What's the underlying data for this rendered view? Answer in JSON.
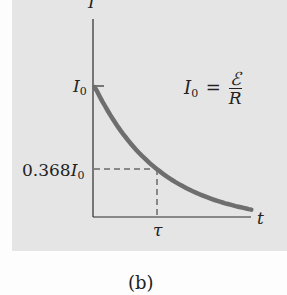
{
  "chart_data": {
    "type": "line",
    "title": "",
    "caption": "(b)",
    "xlabel": "t",
    "ylabel": "I",
    "x_ticks": [
      {
        "label": "τ",
        "value": 1
      }
    ],
    "y_ticks": [
      {
        "label": "I",
        "sub": "0",
        "value": 1.0
      },
      {
        "label": "0.368I",
        "sub": "0",
        "value": 0.368
      }
    ],
    "annotation": {
      "lhs": "I",
      "lhs_sub": "0",
      "eq": "=",
      "numerator": "ℰ",
      "denominator": "R"
    },
    "function": "I(t) = I0 * exp(-t/τ)",
    "series": [
      {
        "name": "I(t)",
        "x": [
          0,
          0.25,
          0.5,
          0.75,
          1.0,
          1.25,
          1.5,
          1.75,
          2.0,
          2.25,
          2.45
        ],
        "y": [
          1.0,
          0.779,
          0.607,
          0.472,
          0.368,
          0.287,
          0.223,
          0.174,
          0.135,
          0.105,
          0.086
        ],
        "color": "#6e6e6e"
      }
    ],
    "reference_lines": [
      {
        "type": "dashed",
        "from": [
          0,
          0.368
        ],
        "to": [
          1,
          0.368
        ]
      },
      {
        "type": "dashed",
        "from": [
          1,
          0.368
        ],
        "to": [
          1,
          0
        ]
      }
    ],
    "xlim": [
      0,
      2.45
    ],
    "ylim": [
      0,
      1.0
    ],
    "grid": false,
    "legend": null
  },
  "labels": {
    "y_axis": "I",
    "x_axis": "t",
    "i0_main": "I",
    "i0_sub": "0",
    "i368_main": "0.368I",
    "i368_sub": "0",
    "tau": "τ",
    "eq_lhs": "I",
    "eq_sub": "0",
    "eq_sign": "=",
    "eq_num": "ℰ",
    "eq_den": "R",
    "caption": "(b)"
  },
  "colors": {
    "panel": "#e5e5e5",
    "curve": "#6e6e6e",
    "axis": "#2a2a2a"
  }
}
